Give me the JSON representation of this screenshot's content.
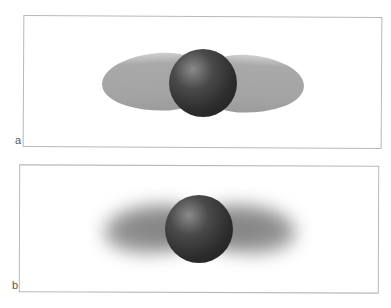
{
  "figure": {
    "panels": [
      {
        "id": "a",
        "label": "a",
        "description": "Dark sphere with sharp-edged gray lobes extending left and right"
      },
      {
        "id": "b",
        "label": "b",
        "description": "Dark sphere with blurred diffuse gray lobes extending left and right"
      }
    ],
    "colors": {
      "sphere": "#2c2c2c",
      "lobe": "#a8a8a8",
      "border": "#b8b8b8"
    }
  }
}
